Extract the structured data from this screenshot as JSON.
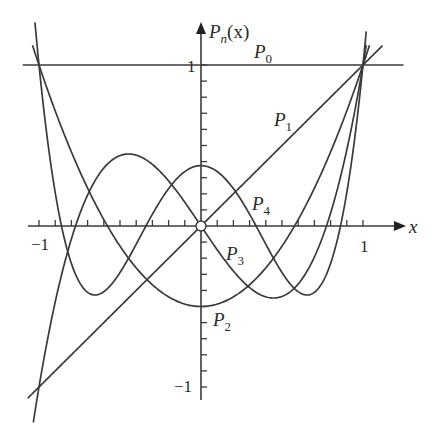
{
  "chart_data": {
    "type": "line",
    "title": "",
    "xlabel": "x",
    "ylabel": "P_n(x)",
    "xlim": [
      -1,
      1
    ],
    "ylim": [
      -1,
      1
    ],
    "grid": false,
    "legend": "inline labels on curves",
    "x_tick_labels": [
      "-1",
      "1"
    ],
    "y_tick_labels": [
      "1",
      "-1"
    ],
    "minor_ticks_per_unit": 10,
    "series": [
      {
        "name": "P0",
        "label_main": "P",
        "label_sub": "0",
        "formula": "1",
        "values_at": {
          "-1": 1,
          "-0.5": 1,
          "0": 1,
          "0.5": 1,
          "1": 1
        }
      },
      {
        "name": "P1",
        "label_main": "P",
        "label_sub": "1",
        "formula": "x",
        "values_at": {
          "-1": -1,
          "-0.5": -0.5,
          "0": 0,
          "0.5": 0.5,
          "1": 1
        }
      },
      {
        "name": "P2",
        "label_main": "P",
        "label_sub": "2",
        "formula": "(3x^2-1)/2",
        "values_at": {
          "-1": 1,
          "-0.5": -0.125,
          "0": -0.5,
          "0.5": -0.125,
          "1": 1
        }
      },
      {
        "name": "P3",
        "label_main": "P",
        "label_sub": "3",
        "formula": "(5x^3-3x)/2",
        "values_at": {
          "-1": -1,
          "-0.5": 0.4375,
          "0": 0,
          "0.5": -0.4375,
          "1": 1
        }
      },
      {
        "name": "P4",
        "label_main": "P",
        "label_sub": "4",
        "formula": "(35x^4-30x^2+3)/8",
        "values_at": {
          "-1": 1,
          "-0.5": -0.2891,
          "0": 0.375,
          "0.5": -0.2891,
          "1": 1
        }
      }
    ]
  },
  "axes": {
    "x_label": "x",
    "y_label_main": "P",
    "y_label_sub": "n",
    "y_label_arg": "(x)",
    "x_tick_neg": "−1",
    "x_tick_pos": "1",
    "y_tick_pos": "1",
    "y_tick_neg": "−1"
  },
  "labels": {
    "p0": {
      "main": "P",
      "sub": "0"
    },
    "p1": {
      "main": "P",
      "sub": "1"
    },
    "p2": {
      "main": "P",
      "sub": "2"
    },
    "p3": {
      "main": "P",
      "sub": "3"
    },
    "p4": {
      "main": "P",
      "sub": "4"
    }
  },
  "colors": {
    "stroke": "#3a3a3a",
    "text": "#2a2a2a",
    "background": "#ffffff"
  }
}
